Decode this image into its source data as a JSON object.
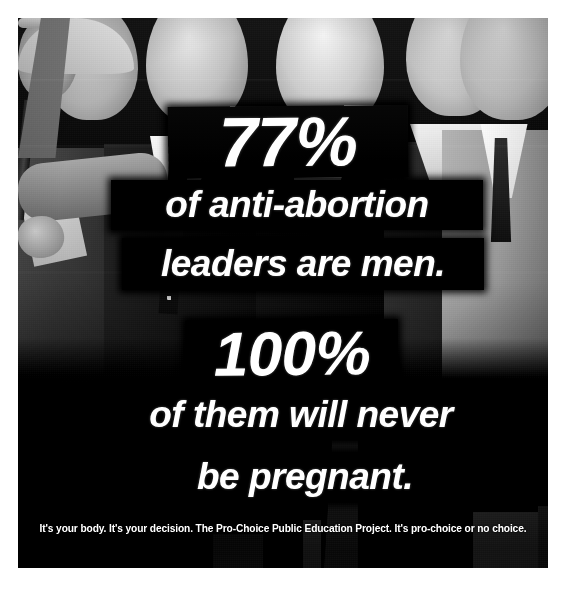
{
  "poster": {
    "medium": "black-and-white photograph with overlaid text banners",
    "lines": [
      {
        "id": "pct1",
        "text": "77%",
        "style": "numeral"
      },
      {
        "id": "anti",
        "text": "of anti-abortion",
        "style": "body"
      },
      {
        "id": "leaders",
        "text": "leaders are men.",
        "style": "body"
      },
      {
        "id": "pct2",
        "text": "100%",
        "style": "numeral"
      },
      {
        "id": "them",
        "text": "of them will never",
        "style": "body"
      },
      {
        "id": "pregnant",
        "text": "be pregnant.",
        "style": "body"
      }
    ],
    "tagline": "It's your body. It's your decision. The Pro-Choice Public Education Project. It's pro-choice or no choice.",
    "organization": "The Pro-Choice Public Education Project",
    "colors": {
      "banner_background": "#080808",
      "banner_text": "#ffffff",
      "page_background": "#ffffff",
      "photo_shadow": "#060606"
    }
  }
}
